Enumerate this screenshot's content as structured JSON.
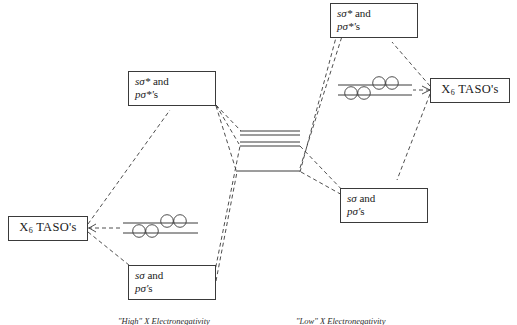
{
  "diagram": {
    "type": "mo-correlation-diagram",
    "ink_color": "#3a3a3a",
    "background": "#ffffff"
  },
  "boxes": {
    "left_taso": {
      "label": "X",
      "subscript": "6",
      "label_tail": " TASO's"
    },
    "right_taso": {
      "label": "X",
      "subscript": "6",
      "label_tail": " TASO's"
    },
    "left_antibonding": {
      "line1_italic": "sσ* ",
      "line1_rest": "and",
      "line2_italic": "pσ*'",
      "line2_rest": "s"
    },
    "left_bonding": {
      "line1_italic": "sσ ",
      "line1_rest": "and",
      "line2_italic": "pσ'",
      "line2_rest": "s"
    },
    "right_antibonding": {
      "line1_italic": "sσ* ",
      "line1_rest": "and",
      "line2_italic": "pσ*'",
      "line2_rest": "s"
    },
    "right_bonding": {
      "line1_italic": "sσ ",
      "line1_rest": "and",
      "line2_italic": "pσ'",
      "line2_rest": "s"
    }
  },
  "captions": {
    "left": "\"High\" X Electronegativity",
    "right": "\"Low\" X Electronegativity"
  },
  "levels": {
    "left_taso_pair": {
      "upper_electrons": 2,
      "lower_electrons": 2,
      "total_circles": 4
    },
    "right_taso_pair": {
      "upper_electrons": 2,
      "lower_electrons": 2,
      "total_circles": 4
    },
    "center_upper_stack_lines": 3,
    "center_lower_line": 1
  }
}
